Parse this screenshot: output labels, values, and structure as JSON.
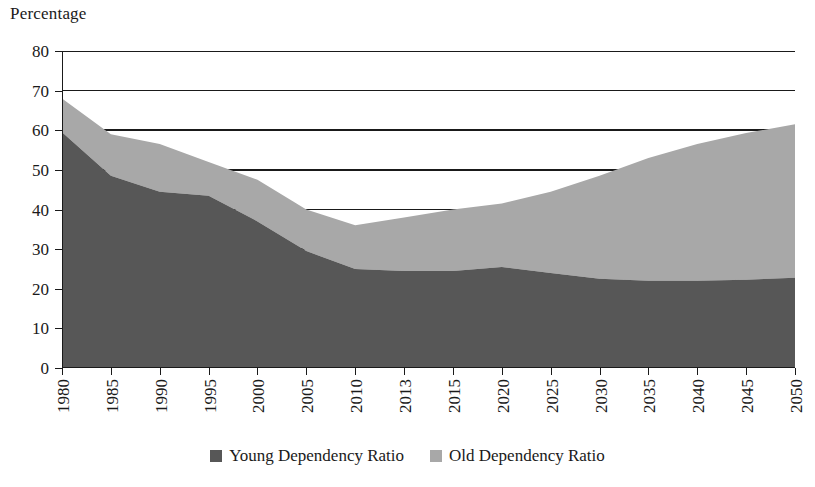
{
  "chart_data": {
    "type": "area",
    "stacked": true,
    "title": "",
    "subtitle": "",
    "xlabel": "",
    "ylabel": "Percentage",
    "ylim": [
      0,
      80
    ],
    "ytick_step": 10,
    "yticks": [
      0,
      10,
      20,
      30,
      40,
      50,
      60,
      70,
      80
    ],
    "grid": "horizontal",
    "legend_position": "bottom-center",
    "categories": [
      "1980",
      "1985",
      "1990",
      "1995",
      "2000",
      "2005",
      "2010",
      "2013",
      "2015",
      "2020",
      "2025",
      "2030",
      "2035",
      "2040",
      "2045",
      "2050"
    ],
    "series": [
      {
        "name": "Young Dependency Ratio",
        "color": "#575757",
        "values": [
          59.5,
          48.5,
          44.5,
          43.5,
          37.0,
          29.5,
          25.0,
          24.5,
          24.5,
          25.5,
          24.0,
          22.5,
          22.0,
          22.0,
          22.3,
          22.8
        ]
      },
      {
        "name": "Old Dependency Ratio",
        "color": "#a8a8a8",
        "values": [
          8.5,
          10.5,
          12.0,
          8.5,
          10.5,
          10.5,
          11.0,
          13.5,
          15.5,
          16.0,
          20.5,
          26.0,
          31.0,
          34.5,
          37.0,
          38.7
        ]
      }
    ],
    "totals": [
      68.0,
      59.0,
      56.5,
      52.0,
      47.5,
      40.0,
      36.0,
      38.0,
      40.0,
      41.5,
      44.5,
      48.5,
      53.0,
      56.5,
      59.3,
      61.5
    ]
  },
  "axis": {
    "y_title": "Percentage",
    "y_tick_labels": [
      "80",
      "70",
      "60",
      "50",
      "40",
      "30",
      "20",
      "10",
      "0"
    ],
    "x_tick_labels": [
      "1980",
      "1985",
      "1990",
      "1995",
      "2000",
      "2005",
      "2010",
      "2013",
      "2015",
      "2020",
      "2025",
      "2030",
      "2035",
      "2040",
      "2045",
      "2050"
    ]
  },
  "legend": {
    "items": [
      {
        "label": "Young Dependency Ratio",
        "color": "#575757"
      },
      {
        "label": "Old Dependency Ratio",
        "color": "#a8a8a8"
      }
    ]
  },
  "colors": {
    "young": "#575757",
    "old": "#a8a8a8",
    "axis": "#1a1a1a",
    "grid": "#1a1a1a",
    "background": "#ffffff"
  }
}
